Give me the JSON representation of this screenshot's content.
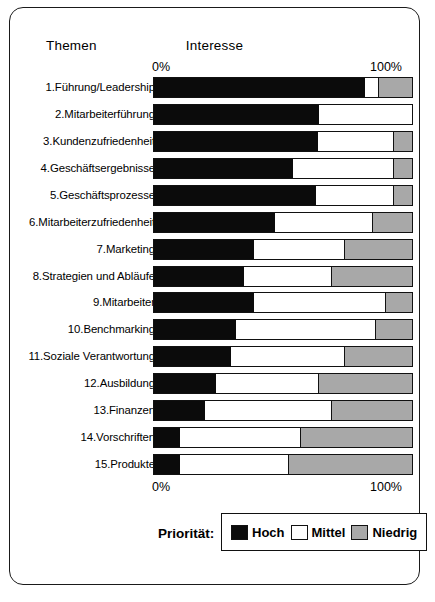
{
  "chart_data": {
    "type": "bar",
    "subtype": "stacked-horizontal-100",
    "title": "Interesse",
    "xlabel": "",
    "ylabel": "Themen",
    "column_header_left": "Themen",
    "column_header_right": "Interesse",
    "xlim": [
      0,
      100
    ],
    "grid": false,
    "tick_labels": [
      "0%",
      "100%"
    ],
    "axis_top": {
      "left": "0%",
      "right": "100%"
    },
    "axis_bottom": {
      "left": "0%",
      "right": "100%"
    },
    "legend": {
      "position": "bottom",
      "caption": "Priorität:",
      "entries": [
        {
          "name": "Hoch",
          "color": "#0b0b0b"
        },
        {
          "name": "Mittel",
          "color": "#ffffff"
        },
        {
          "name": "Niedrig",
          "color": "#a8a8a8"
        }
      ]
    },
    "categories": [
      "1.Führung/Leadership",
      "2.Mitarbeiterführung",
      "3.Kundenzufriedenheit",
      "4.Geschäftsergebnisse",
      "5.Geschäftsprozesse",
      "6.Mitarbeiterzufriedenheit",
      "7.Marketing",
      "8.Strategien und Abläufe",
      "9.Mitarbeiter",
      "10.Benchmarking",
      "11.Soziale Verantwortung",
      "12.Ausbildung",
      "13.Finanzen",
      "14.Vorschriften",
      "15.Produkte"
    ],
    "series": [
      {
        "name": "Hoch",
        "color": "#0b0b0b",
        "values": [
          82,
          64,
          64,
          54,
          63,
          47,
          39,
          35,
          39,
          32,
          30,
          24,
          20,
          10,
          10
        ]
      },
      {
        "name": "Mittel",
        "color": "#ffffff",
        "values": [
          5,
          36,
          29,
          39,
          30,
          38,
          35,
          34,
          51,
          54,
          44,
          40,
          49,
          47,
          42
        ]
      },
      {
        "name": "Niedrig",
        "color": "#a8a8a8",
        "values": [
          13,
          0,
          7,
          7,
          7,
          15,
          26,
          31,
          10,
          14,
          26,
          36,
          31,
          43,
          48
        ]
      }
    ],
    "rows": [
      {
        "label": "1.Führung/Leadership",
        "hoch": 82,
        "mittel": 5,
        "niedrig": 13
      },
      {
        "label": "2.Mitarbeiterführung",
        "hoch": 64,
        "mittel": 36,
        "niedrig": 0
      },
      {
        "label": "3.Kundenzufriedenheit",
        "hoch": 64,
        "mittel": 29,
        "niedrig": 7
      },
      {
        "label": "4.Geschäftsergebnisse",
        "hoch": 54,
        "mittel": 39,
        "niedrig": 7
      },
      {
        "label": "5.Geschäftsprozesse",
        "hoch": 63,
        "mittel": 30,
        "niedrig": 7
      },
      {
        "label": "6.Mitarbeiterzufriedenheit",
        "hoch": 47,
        "mittel": 38,
        "niedrig": 15
      },
      {
        "label": "7.Marketing",
        "hoch": 39,
        "mittel": 35,
        "niedrig": 26
      },
      {
        "label": "8.Strategien und Abläufe",
        "hoch": 35,
        "mittel": 34,
        "niedrig": 31
      },
      {
        "label": "9.Mitarbeiter",
        "hoch": 39,
        "mittel": 51,
        "niedrig": 10
      },
      {
        "label": "10.Benchmarking",
        "hoch": 32,
        "mittel": 54,
        "niedrig": 14
      },
      {
        "label": "11.Soziale Verantwortung",
        "hoch": 30,
        "mittel": 44,
        "niedrig": 26
      },
      {
        "label": "12.Ausbildung",
        "hoch": 24,
        "mittel": 40,
        "niedrig": 36
      },
      {
        "label": "13.Finanzen",
        "hoch": 20,
        "mittel": 49,
        "niedrig": 31
      },
      {
        "label": "14.Vorschriften",
        "hoch": 10,
        "mittel": 47,
        "niedrig": 43
      },
      {
        "label": "15.Produkte",
        "hoch": 10,
        "mittel": 42,
        "niedrig": 48
      }
    ]
  }
}
